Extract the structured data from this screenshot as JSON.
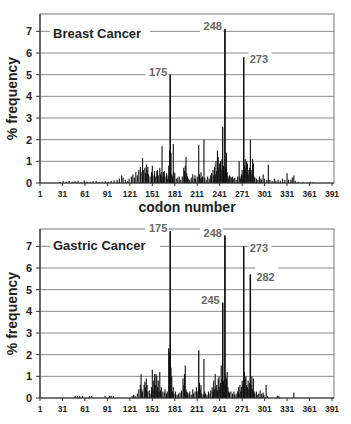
{
  "figure": {
    "xlabel": "codon number",
    "ylabel": "% frequency"
  },
  "chart_data": [
    {
      "type": "bar",
      "title": "Breast Cancer",
      "xlabel": "codon number",
      "ylabel": "% frequency",
      "xlim": [
        1,
        391
      ],
      "ylim": [
        0,
        7.8
      ],
      "xticks": [
        1,
        31,
        61,
        91,
        121,
        151,
        181,
        211,
        241,
        271,
        301,
        331,
        361,
        391
      ],
      "yticks": [
        0,
        1,
        2,
        3,
        4,
        5,
        6,
        7
      ],
      "grid": true,
      "annotations": [
        {
          "label": "175",
          "x": 175,
          "y": 5.0
        },
        {
          "label": "248",
          "x": 248,
          "y": 7.1
        },
        {
          "label": "273",
          "x": 273,
          "y": 5.8
        }
      ],
      "points": [
        [
          28,
          0.05
        ],
        [
          32,
          0.08
        ],
        [
          36,
          0.05
        ],
        [
          40,
          0.1
        ],
        [
          44,
          0.06
        ],
        [
          48,
          0.08
        ],
        [
          52,
          0.1
        ],
        [
          56,
          0.05
        ],
        [
          60,
          0.12
        ],
        [
          64,
          0.06
        ],
        [
          68,
          0.05
        ],
        [
          72,
          0.08
        ],
        [
          76,
          0.1
        ],
        [
          80,
          0.05
        ],
        [
          84,
          0.06
        ],
        [
          88,
          0.08
        ],
        [
          92,
          0.05
        ],
        [
          96,
          0.1
        ],
        [
          100,
          0.12
        ],
        [
          104,
          0.15
        ],
        [
          107,
          0.2
        ],
        [
          110,
          0.35
        ],
        [
          112,
          0.25
        ],
        [
          115,
          0.15
        ],
        [
          118,
          0.1
        ],
        [
          120,
          0.2
        ],
        [
          123,
          0.3
        ],
        [
          125,
          0.4
        ],
        [
          127,
          0.25
        ],
        [
          129,
          0.5
        ],
        [
          131,
          0.35
        ],
        [
          133,
          0.6
        ],
        [
          135,
          0.75
        ],
        [
          136,
          0.5
        ],
        [
          138,
          1.15
        ],
        [
          139,
          0.6
        ],
        [
          141,
          0.7
        ],
        [
          142,
          0.45
        ],
        [
          143,
          0.85
        ],
        [
          144,
          0.6
        ],
        [
          145,
          0.75
        ],
        [
          146,
          0.4
        ],
        [
          148,
          0.3
        ],
        [
          150,
          0.5
        ],
        [
          151,
          0.8
        ],
        [
          152,
          0.35
        ],
        [
          154,
          0.55
        ],
        [
          155,
          0.3
        ],
        [
          157,
          0.55
        ],
        [
          158,
          0.6
        ],
        [
          159,
          0.35
        ],
        [
          161,
          0.7
        ],
        [
          162,
          0.4
        ],
        [
          163,
          0.5
        ],
        [
          164,
          1.7
        ],
        [
          165,
          0.3
        ],
        [
          166,
          0.5
        ],
        [
          167,
          0.55
        ],
        [
          168,
          0.3
        ],
        [
          170,
          0.45
        ],
        [
          171,
          0.2
        ],
        [
          172,
          0.35
        ],
        [
          173,
          0.8
        ],
        [
          174,
          1.5
        ],
        [
          175,
          5.0
        ],
        [
          176,
          1.4
        ],
        [
          177,
          0.4
        ],
        [
          178,
          0.3
        ],
        [
          179,
          1.8
        ],
        [
          180,
          0.5
        ],
        [
          181,
          0.45
        ],
        [
          183,
          0.2
        ],
        [
          185,
          0.25
        ],
        [
          187,
          0.3
        ],
        [
          189,
          0.15
        ],
        [
          191,
          0.3
        ],
        [
          193,
          0.7
        ],
        [
          194,
          0.55
        ],
        [
          195,
          0.8
        ],
        [
          196,
          1.2
        ],
        [
          197,
          0.45
        ],
        [
          198,
          0.3
        ],
        [
          199,
          0.2
        ],
        [
          201,
          0.15
        ],
        [
          203,
          0.25
        ],
        [
          205,
          0.4
        ],
        [
          207,
          0.2
        ],
        [
          208,
          0.35
        ],
        [
          209,
          0.2
        ],
        [
          211,
          0.3
        ],
        [
          213,
          1.75
        ],
        [
          214,
          0.4
        ],
        [
          215,
          0.2
        ],
        [
          216,
          0.5
        ],
        [
          217,
          0.25
        ],
        [
          218,
          0.3
        ],
        [
          220,
          2.0
        ],
        [
          221,
          0.25
        ],
        [
          223,
          0.15
        ],
        [
          225,
          0.3
        ],
        [
          227,
          0.2
        ],
        [
          229,
          0.35
        ],
        [
          230,
          0.45
        ],
        [
          232,
          0.6
        ],
        [
          233,
          0.35
        ],
        [
          234,
          0.75
        ],
        [
          235,
          0.4
        ],
        [
          236,
          1.0
        ],
        [
          237,
          0.55
        ],
        [
          238,
          1.5
        ],
        [
          239,
          1.2
        ],
        [
          240,
          0.7
        ],
        [
          241,
          0.9
        ],
        [
          242,
          1.0
        ],
        [
          243,
          0.6
        ],
        [
          244,
          1.1
        ],
        [
          245,
          2.6
        ],
        [
          246,
          0.8
        ],
        [
          247,
          0.5
        ],
        [
          248,
          7.1
        ],
        [
          249,
          0.7
        ],
        [
          250,
          1.4
        ],
        [
          251,
          0.5
        ],
        [
          252,
          0.3
        ],
        [
          253,
          0.2
        ],
        [
          254,
          0.35
        ],
        [
          255,
          0.3
        ],
        [
          257,
          0.25
        ],
        [
          258,
          0.3
        ],
        [
          259,
          0.2
        ],
        [
          261,
          0.25
        ],
        [
          263,
          0.15
        ],
        [
          265,
          0.3
        ],
        [
          267,
          1.0
        ],
        [
          268,
          0.3
        ],
        [
          269,
          0.2
        ],
        [
          270,
          0.4
        ],
        [
          271,
          0.6
        ],
        [
          272,
          0.35
        ],
        [
          273,
          5.8
        ],
        [
          274,
          0.8
        ],
        [
          275,
          1.1
        ],
        [
          276,
          0.7
        ],
        [
          277,
          1.0
        ],
        [
          278,
          0.9
        ],
        [
          279,
          0.4
        ],
        [
          280,
          0.6
        ],
        [
          281,
          0.7
        ],
        [
          282,
          2.0
        ],
        [
          283,
          0.6
        ],
        [
          284,
          0.4
        ],
        [
          285,
          1.1
        ],
        [
          286,
          0.9
        ],
        [
          287,
          0.3
        ],
        [
          288,
          0.25
        ],
        [
          290,
          0.2
        ],
        [
          292,
          0.15
        ],
        [
          294,
          0.3
        ],
        [
          296,
          0.2
        ],
        [
          297,
          0.15
        ],
        [
          299,
          0.4
        ],
        [
          301,
          0.2
        ],
        [
          304,
          0.15
        ],
        [
          306,
          0.85
        ],
        [
          308,
          0.15
        ],
        [
          311,
          0.1
        ],
        [
          314,
          0.2
        ],
        [
          316,
          0.1
        ],
        [
          319,
          0.15
        ],
        [
          322,
          0.1
        ],
        [
          325,
          0.2
        ],
        [
          328,
          0.15
        ],
        [
          331,
          0.45
        ],
        [
          333,
          0.15
        ],
        [
          336,
          0.15
        ],
        [
          338,
          0.25
        ],
        [
          340,
          0.35
        ],
        [
          342,
          0.1
        ],
        [
          346,
          0.05
        ],
        [
          352,
          0.05
        ],
        [
          358,
          0.03
        ],
        [
          362,
          0.06
        ],
        [
          366,
          0.04
        ]
      ]
    },
    {
      "type": "bar",
      "title": "Gastric Cancer",
      "xlabel": "",
      "ylabel": "% frequency",
      "xlim": [
        1,
        391
      ],
      "ylim": [
        0,
        7.8
      ],
      "xticks": [
        1,
        31,
        61,
        91,
        121,
        151,
        181,
        211,
        241,
        271,
        301,
        331,
        361,
        391
      ],
      "yticks": [
        0,
        1,
        2,
        3,
        4,
        5,
        6,
        7
      ],
      "grid": true,
      "annotations": [
        {
          "label": "175",
          "x": 175,
          "y": 7.7
        },
        {
          "label": "248",
          "x": 248,
          "y": 7.5
        },
        {
          "label": "273",
          "x": 273,
          "y": 7.0
        },
        {
          "label": "282",
          "x": 282,
          "y": 5.7
        },
        {
          "label": "245",
          "x": 245,
          "y": 4.4
        }
      ],
      "points": [
        [
          48,
          0.1
        ],
        [
          51,
          0.1
        ],
        [
          54,
          0.1
        ],
        [
          58,
          0.1
        ],
        [
          67,
          0.1
        ],
        [
          70,
          0.1
        ],
        [
          88,
          0.1
        ],
        [
          94,
          0.1
        ],
        [
          96,
          0.1
        ],
        [
          99,
          0.1
        ],
        [
          124,
          0.1
        ],
        [
          126,
          0.15
        ],
        [
          128,
          0.1
        ],
        [
          131,
          0.2
        ],
        [
          133,
          0.4
        ],
        [
          135,
          0.6
        ],
        [
          136,
          1.1
        ],
        [
          137,
          0.4
        ],
        [
          138,
          0.3
        ],
        [
          140,
          0.6
        ],
        [
          141,
          0.75
        ],
        [
          142,
          0.5
        ],
        [
          143,
          0.9
        ],
        [
          144,
          0.6
        ],
        [
          145,
          0.3
        ],
        [
          147,
          0.35
        ],
        [
          148,
          0.2
        ],
        [
          150,
          0.5
        ],
        [
          151,
          1.3
        ],
        [
          152,
          0.4
        ],
        [
          153,
          0.8
        ],
        [
          154,
          1.1
        ],
        [
          155,
          0.6
        ],
        [
          156,
          1.1
        ],
        [
          157,
          1.0
        ],
        [
          158,
          0.5
        ],
        [
          159,
          0.8
        ],
        [
          160,
          0.3
        ],
        [
          161,
          1.2
        ],
        [
          162,
          0.35
        ],
        [
          163,
          0.5
        ],
        [
          165,
          0.3
        ],
        [
          167,
          0.25
        ],
        [
          168,
          0.4
        ],
        [
          170,
          0.2
        ],
        [
          171,
          0.3
        ],
        [
          173,
          2.3
        ],
        [
          174,
          2.1
        ],
        [
          175,
          7.7
        ],
        [
          176,
          1.4
        ],
        [
          177,
          1.0
        ],
        [
          178,
          0.3
        ],
        [
          179,
          0.5
        ],
        [
          180,
          0.2
        ],
        [
          182,
          0.3
        ],
        [
          184,
          0.15
        ],
        [
          186,
          0.2
        ],
        [
          188,
          0.25
        ],
        [
          190,
          0.35
        ],
        [
          192,
          0.9
        ],
        [
          193,
          0.6
        ],
        [
          194,
          1.1
        ],
        [
          195,
          1.5
        ],
        [
          196,
          0.4
        ],
        [
          197,
          0.3
        ],
        [
          198,
          0.25
        ],
        [
          200,
          0.2
        ],
        [
          201,
          0.3
        ],
        [
          203,
          0.15
        ],
        [
          205,
          0.4
        ],
        [
          206,
          0.2
        ],
        [
          208,
          0.3
        ],
        [
          210,
          0.5
        ],
        [
          211,
          0.3
        ],
        [
          213,
          2.2
        ],
        [
          214,
          0.7
        ],
        [
          215,
          0.4
        ],
        [
          216,
          0.6
        ],
        [
          217,
          0.2
        ],
        [
          219,
          0.15
        ],
        [
          220,
          1.8
        ],
        [
          221,
          0.3
        ],
        [
          222,
          0.2
        ],
        [
          224,
          0.15
        ],
        [
          226,
          0.3
        ],
        [
          228,
          0.2
        ],
        [
          229,
          0.35
        ],
        [
          231,
          0.5
        ],
        [
          232,
          0.3
        ],
        [
          233,
          0.8
        ],
        [
          234,
          0.4
        ],
        [
          235,
          1.1
        ],
        [
          236,
          0.5
        ],
        [
          237,
          0.6
        ],
        [
          238,
          0.35
        ],
        [
          239,
          0.9
        ],
        [
          240,
          1.0
        ],
        [
          241,
          0.5
        ],
        [
          242,
          0.7
        ],
        [
          243,
          1.5
        ],
        [
          244,
          0.9
        ],
        [
          245,
          4.4
        ],
        [
          246,
          0.8
        ],
        [
          247,
          0.6
        ],
        [
          248,
          7.5
        ],
        [
          249,
          1.0
        ],
        [
          250,
          0.9
        ],
        [
          251,
          1.2
        ],
        [
          252,
          0.5
        ],
        [
          253,
          0.3
        ],
        [
          254,
          0.25
        ],
        [
          256,
          0.3
        ],
        [
          258,
          0.2
        ],
        [
          260,
          0.3
        ],
        [
          261,
          0.15
        ],
        [
          263,
          0.2
        ],
        [
          265,
          0.3
        ],
        [
          266,
          0.5
        ],
        [
          267,
          0.2
        ],
        [
          268,
          0.6
        ],
        [
          269,
          0.3
        ],
        [
          270,
          0.5
        ],
        [
          271,
          0.8
        ],
        [
          272,
          0.6
        ],
        [
          273,
          7.0
        ],
        [
          274,
          1.2
        ],
        [
          275,
          0.9
        ],
        [
          276,
          1.0
        ],
        [
          277,
          0.6
        ],
        [
          278,
          0.5
        ],
        [
          279,
          0.8
        ],
        [
          280,
          0.4
        ],
        [
          281,
          0.7
        ],
        [
          282,
          5.7
        ],
        [
          283,
          0.6
        ],
        [
          284,
          1.0
        ],
        [
          285,
          0.4
        ],
        [
          286,
          0.9
        ],
        [
          287,
          0.3
        ],
        [
          288,
          0.2
        ],
        [
          290,
          0.3
        ],
        [
          291,
          0.15
        ],
        [
          293,
          0.2
        ],
        [
          295,
          0.35
        ],
        [
          297,
          0.2
        ],
        [
          299,
          0.25
        ],
        [
          300,
          0.15
        ],
        [
          303,
          0.6
        ],
        [
          305,
          0.1
        ],
        [
          318,
          0.1
        ],
        [
          320,
          0.1
        ],
        [
          340,
          0.25
        ]
      ]
    }
  ]
}
